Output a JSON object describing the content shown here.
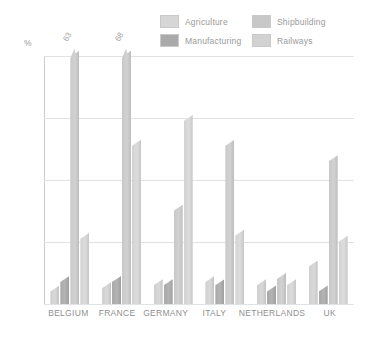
{
  "legend": {
    "items": [
      {
        "label": "Agriculture",
        "color": "#d6d6d6",
        "key": "s0"
      },
      {
        "label": "Shipbuilding",
        "color": "#c8c8c8",
        "key": "s2"
      },
      {
        "label": "Manufacturing",
        "color": "#aaaaaa",
        "key": "s1"
      },
      {
        "label": "Railways",
        "color": "#d2d2d2",
        "key": "s3"
      }
    ]
  },
  "axis": {
    "y_unit": "%",
    "ticks": [
      "40",
      "30",
      "20",
      "10",
      "0"
    ]
  },
  "chart_data": {
    "type": "bar",
    "title": "",
    "xlabel": "",
    "ylabel": "%",
    "ylim": [
      0,
      40
    ],
    "grid": true,
    "legend_position": "top-right",
    "categories": [
      "BELGIUM",
      "FRANCE",
      "GERMANY",
      "ITALY",
      "NETHERLANDS",
      "UK"
    ],
    "series": [
      {
        "name": "Agriculture",
        "values": [
          3.0,
          3.5,
          4.0,
          4.5,
          4.0,
          7.0
        ]
      },
      {
        "name": "Manufacturing",
        "values": [
          4.5,
          4.5,
          4.0,
          4.0,
          3.0,
          3.0
        ]
      },
      {
        "name": "Shipbuilding",
        "values": [
          63.0,
          68.0,
          16.0,
          26.5,
          5.0,
          24.0
        ]
      },
      {
        "name": "Railways",
        "values": [
          11.5,
          26.5,
          30.5,
          12.0,
          4.0,
          11.0
        ]
      }
    ],
    "clipped_value_labels": [
      {
        "category": "BELGIUM",
        "series": "Shipbuilding",
        "label": "63"
      },
      {
        "category": "FRANCE",
        "series": "Shipbuilding",
        "label": "68"
      }
    ]
  }
}
